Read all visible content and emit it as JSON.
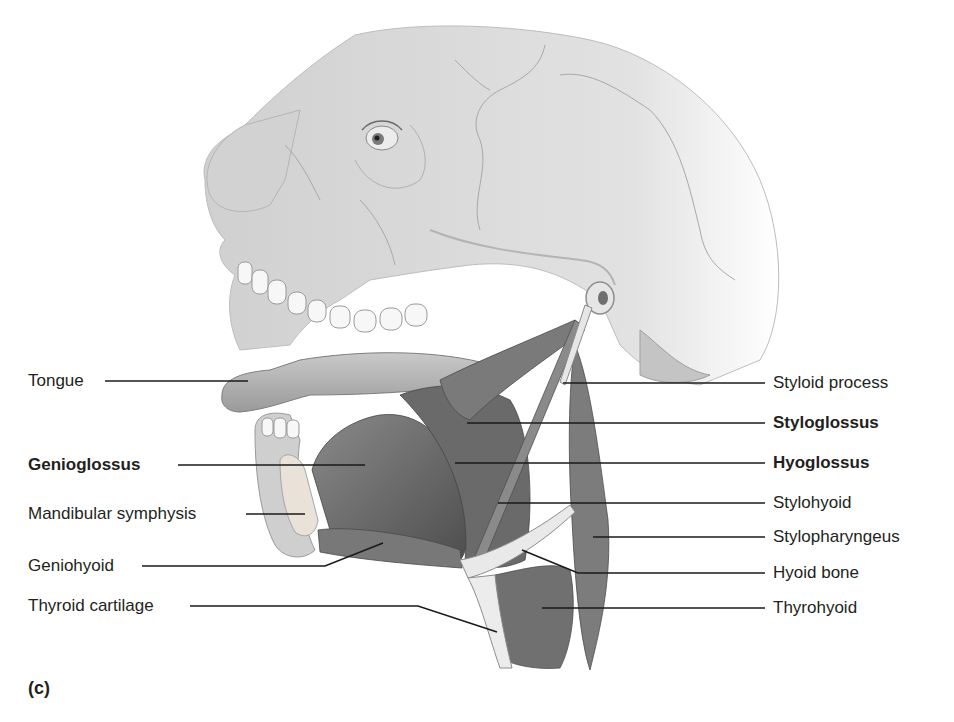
{
  "figure": {
    "panel_letter": "(c)",
    "colors": {
      "background": "#ffffff",
      "text": "#231f20",
      "leader_line": "#1a1a1a",
      "skull": "#d6d6d6",
      "muscle": "#6e6e6e",
      "bone_cartilage": "#e4e4e4"
    }
  },
  "labels_left": [
    {
      "text": "Tongue",
      "bold": false
    },
    {
      "text": "Genioglossus",
      "bold": true
    },
    {
      "text": "Mandibular symphysis",
      "bold": false
    },
    {
      "text": "Geniohyoid",
      "bold": false
    },
    {
      "text": "Thyroid cartilage",
      "bold": false
    }
  ],
  "labels_right": [
    {
      "text": "Styloid process",
      "bold": false
    },
    {
      "text": "Styloglossus",
      "bold": true
    },
    {
      "text": "Hyoglossus",
      "bold": true
    },
    {
      "text": "Stylohyoid",
      "bold": false
    },
    {
      "text": "Stylopharyngeus",
      "bold": false
    },
    {
      "text": "Hyoid bone",
      "bold": false
    },
    {
      "text": "Thyrohyoid",
      "bold": false
    }
  ]
}
